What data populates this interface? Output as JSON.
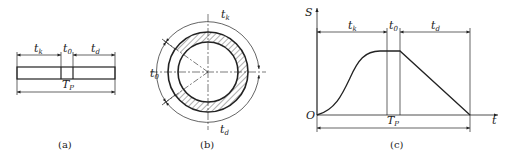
{
  "figure_a": {
    "caption": "(a)",
    "labels": {
      "tk": {
        "main": "t",
        "sub": "k"
      },
      "t0": {
        "main": "t",
        "sub": "0"
      },
      "td": {
        "main": "t",
        "sub": "d"
      },
      "tp": {
        "main": "T",
        "sub": "P"
      }
    }
  },
  "figure_b": {
    "caption": "(b)",
    "labels": {
      "tk": {
        "main": "t",
        "sub": "k"
      },
      "t0": {
        "main": "t",
        "sub": "0"
      },
      "td": {
        "main": "t",
        "sub": "d"
      }
    }
  },
  "figure_c": {
    "caption": "(c)",
    "axis": {
      "y_label": "S",
      "x_label": "t",
      "origin": "O"
    },
    "labels": {
      "tk": {
        "main": "t",
        "sub": "k"
      },
      "t0": {
        "main": "t",
        "sub": "0"
      },
      "td": {
        "main": "t",
        "sub": "d"
      },
      "tp": {
        "main": "T",
        "sub": "P"
      }
    }
  },
  "colors": {
    "line": "#222222",
    "background": "#ffffff"
  }
}
